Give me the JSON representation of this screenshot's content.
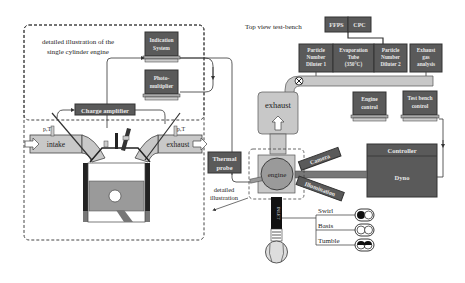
{
  "colors": {
    "dark_box": "#5a5a5a",
    "dark_box_text": "#e8e8e8",
    "light_gray": "#c8c8c8",
    "mid_gray": "#9a9a9a",
    "line": "#333333",
    "background": "#ffffff"
  },
  "left_panel": {
    "caption_line1": "detailed illustration of the",
    "caption_line2": "single cylinder engine",
    "indication_system_line1": "Indication",
    "indication_system_line2": "System",
    "photomultiplier_line1": "Photo-",
    "photomultiplier_line2": "multiplier",
    "charge_amplifier": "Charge amplifier",
    "intake_label": "intake",
    "exhaust_label": "exhaust",
    "pt_left": "p,T",
    "pt_right": "p,T"
  },
  "middle": {
    "thermal_probe_line1": "Thermal",
    "thermal_probe_line2": "probe",
    "detailed_line1": "detailed",
    "detailed_line2": "illustration"
  },
  "test_bench": {
    "title": "Top view test-bench",
    "ffps": "FFPS",
    "cpc": "CPC",
    "pnd1": [
      "Particle",
      "Number",
      "Diluter 1"
    ],
    "evap": [
      "Evaporation",
      "Tube",
      "(350°C)"
    ],
    "pnd2": [
      "Particle",
      "Number",
      "Diluter 2"
    ],
    "exhaust_gas": [
      "Exhaust",
      "gas",
      "analysis"
    ],
    "exhaust_label": "exhaust",
    "engine_control_line1": "Engine",
    "engine_control_line2": "control",
    "test_bench_control_line1": "Test bench",
    "test_bench_control_line2": "control",
    "controller": "Controller",
    "dyno": "Dyno",
    "engine": "engine",
    "camera": "Camera",
    "illumination": "Illumination",
    "inlet": "INLET",
    "swirl": "Swirl",
    "basis": "Basis",
    "tumble": "Tumble"
  }
}
